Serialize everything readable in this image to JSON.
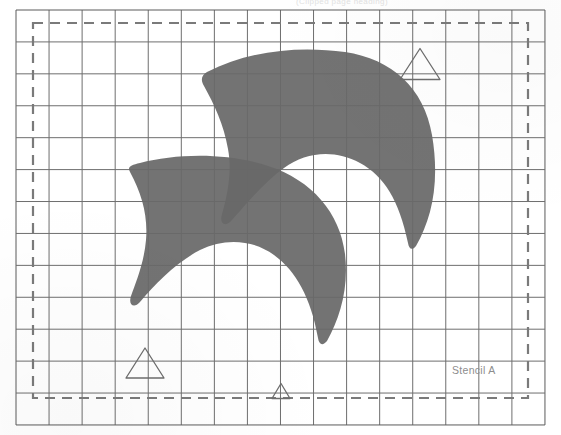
{
  "page": {
    "width": 561,
    "height": 435,
    "background": "#ffffff",
    "header_text": "(Clipped page heading)"
  },
  "label": {
    "stencil": "Stencil A"
  },
  "colors": {
    "paper": "#ffffff",
    "grid_line": "#6e6e6e",
    "grid_outer": "#5a5a5a",
    "dashed_border": "#7a7a7a",
    "shape_fill": "#686868",
    "triangle_stroke": "#6d6d6d",
    "label_text": "#8d8d8d",
    "header_text": "#e2e2e2"
  },
  "grid": {
    "x0": 16,
    "y0": 10,
    "cell_w": 33.06,
    "cell_h": 31.92,
    "cols": 16,
    "rows": 13,
    "line_width": 1,
    "note": "graph-paper grid of thin dark rules"
  },
  "dashed_border": {
    "x": 33,
    "y": 23,
    "width": 495,
    "height": 375,
    "dash": "10 7",
    "stroke_width": 2.2
  },
  "triangles": [
    {
      "name": "triangle-marker-top-right",
      "cx": 420,
      "cy": 64,
      "half_base": 20,
      "height": 31
    },
    {
      "name": "triangle-marker-bottom-left",
      "cx": 145,
      "cy": 363,
      "half_base": 19,
      "height": 30
    },
    {
      "name": "triangle-marker-bottom-center",
      "cx": 281,
      "cy": 391,
      "half_base": 9,
      "height": 15
    }
  ],
  "shapes": [
    {
      "name": "stencil-blade-upper",
      "fill": "#686868",
      "path": "M 207 72 C 250 50 300 46 345 52 C 392 59 424 88 432 135 C 440 182 432 218 416 246 C 412 251 409 249 408 243 C 399 200 384 176 360 163 C 334 149 306 152 284 168 C 262 184 244 207 232 220 C 225 228 219 224 222 214 C 228 193 232 170 228 149 C 224 125 214 104 204 86 C 200 79 202 75 207 72 Z"
    },
    {
      "name": "stencil-blade-lower",
      "fill": "#686868",
      "path": "M 130 172 C 142 194 148 216 146 240 C 144 263 136 282 131 296 C 128 305 134 309 140 302 C 156 283 177 262 200 250 C 224 238 252 239 274 255 C 296 271 311 298 318 338 C 319 345 323 346 327 341 C 340 318 349 288 345 254 C 340 213 312 180 268 166 C 224 152 176 154 140 163 C 131 165 127 167 130 172 Z"
    }
  ]
}
